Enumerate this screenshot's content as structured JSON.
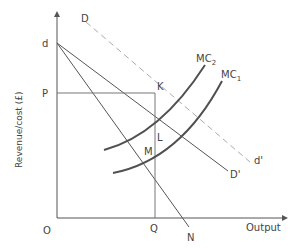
{
  "diagram": {
    "type": "economics-revenue-cost-diagram",
    "axes": {
      "y_label": "Revenue/cost (£)",
      "x_label": "Output",
      "origin_label": "O"
    },
    "points": {
      "d": "d",
      "P": "P",
      "K": "K",
      "L": "L",
      "M": "M",
      "Q": "Q",
      "N": "N"
    },
    "curves": {
      "D_start": "D",
      "d_prime": "d'",
      "D_prime": "D'",
      "MC2": {
        "main": "MC",
        "sub": "2"
      },
      "MC1": {
        "main": "MC",
        "sub": "1"
      }
    },
    "colors": {
      "axis": "#555555",
      "line": "#555555",
      "dashed": "#aaaaaa",
      "curve": "#505050",
      "text": "#444444"
    }
  }
}
